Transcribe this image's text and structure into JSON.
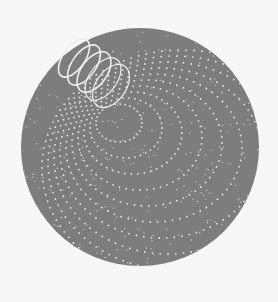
{
  "image": {
    "width": 278,
    "height": 302,
    "background": "#f7f7f7",
    "description": "Grey disc with a white helical coil and dotted concentric ring pattern"
  },
  "disc": {
    "cx": 140,
    "cy": 147,
    "r": 119,
    "fill": "#7d7d7d"
  },
  "coil": {
    "color": "#eeeeee",
    "loops": [
      {
        "cx": 74,
        "cy": 58,
        "rx": 11,
        "ry": 22,
        "rot": 35
      },
      {
        "cx": 84,
        "cy": 65,
        "rx": 12,
        "ry": 23,
        "rot": 35
      },
      {
        "cx": 94,
        "cy": 72,
        "rx": 13,
        "ry": 23,
        "rot": 35
      },
      {
        "cx": 103,
        "cy": 79,
        "rx": 14,
        "ry": 24,
        "rot": 35
      },
      {
        "cx": 111,
        "cy": 86,
        "rx": 15,
        "ry": 24,
        "rot": 35
      }
    ]
  },
  "rings": {
    "color": "#e6e6e6",
    "origin": {
      "x": 112,
      "y": 118
    },
    "count": 10
  }
}
